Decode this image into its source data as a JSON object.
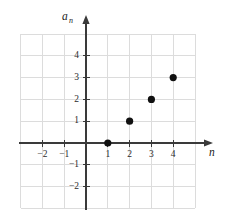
{
  "chart_data": {
    "type": "scatter",
    "title": "",
    "xlabel": "n",
    "ylabel": "a_n",
    "ylabel_base": "a",
    "ylabel_subscript": "n",
    "x": [
      1,
      2,
      3,
      4
    ],
    "values": [
      0,
      1,
      2,
      3
    ],
    "points": [
      {
        "label": "(1, 0)",
        "x": 1,
        "y": 0
      },
      {
        "label": "(2, 1)",
        "x": 2,
        "y": 1
      },
      {
        "label": "(3, 2)",
        "x": 3,
        "y": 2
      },
      {
        "label": "(4, 3)",
        "x": 4,
        "y": 3
      }
    ],
    "xlim": [
      -3,
      5
    ],
    "ylim": [
      -3,
      5
    ],
    "xticks": [
      -2,
      -1,
      1,
      2,
      3,
      4
    ],
    "xtick_labels": [
      "−2",
      "−1",
      "1",
      "2",
      "3",
      "4"
    ],
    "yticks": [
      4,
      3,
      2,
      1,
      -1,
      -2
    ],
    "ytick_labels": [
      "4",
      "3",
      "2",
      "1",
      "−1",
      "−2"
    ],
    "grid": true,
    "grid_step": 1,
    "legend": null,
    "marker": "filled-circle",
    "marker_color": "#111111",
    "grid_color": "#dcdcdc",
    "axis_color": "#3a3a3a",
    "background_color": "#ffffff"
  }
}
